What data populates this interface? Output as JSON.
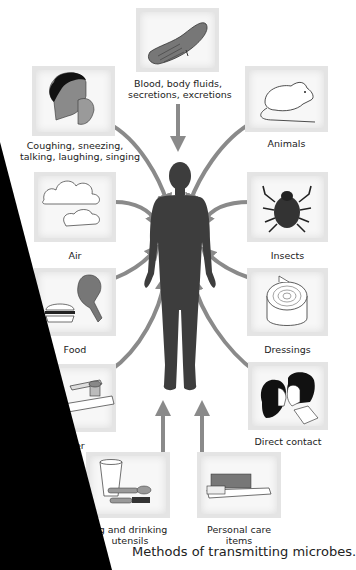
{
  "diagram": {
    "title": "Methods of transmitting microbes",
    "caption": "Methods of transmitting microbes.",
    "center": {
      "label": "Human body",
      "icon": "human-silhouette-icon"
    },
    "colors": {
      "arrow": "#8a8a8a",
      "figure": "#3d3d3d",
      "box_bg": "#f7f7f7",
      "box_border": "#e0e0e0",
      "occluder": "#000000"
    },
    "sources": [
      {
        "id": "blood",
        "label_lines": [
          "Blood, body fluids,",
          "secretions, excretions"
        ],
        "icon": "bleeding-hand-icon",
        "arrow": "down"
      },
      {
        "id": "coughing",
        "label_lines": [
          "Coughing, sneezing,",
          "talking, laughing, singing"
        ],
        "icon": "coughing-person-icon",
        "arrow": "curved-inward"
      },
      {
        "id": "animals",
        "label_lines": [
          "Animals"
        ],
        "icon": "rat-icon",
        "arrow": "curved-inward"
      },
      {
        "id": "air",
        "label_lines": [
          "Air"
        ],
        "icon": "clouds-icon",
        "arrow": "curved-inward"
      },
      {
        "id": "insects",
        "label_lines": [
          "Insects"
        ],
        "icon": "tick-icon",
        "arrow": "curved-inward"
      },
      {
        "id": "food",
        "label_lines": [
          "Food"
        ],
        "icon": "burger-drumstick-icon",
        "arrow": "curved-inward"
      },
      {
        "id": "dressings",
        "label_lines": [
          "Dressings"
        ],
        "icon": "bandage-roll-icon",
        "arrow": "curved-inward"
      },
      {
        "id": "water",
        "label_lines": [
          "ater"
        ],
        "icon": "faucet-icon",
        "arrow": "curved-inward"
      },
      {
        "id": "direct-contact",
        "label_lines": [
          "Direct contact"
        ],
        "icon": "kissing-couple-icon",
        "arrow": "curved-inward"
      },
      {
        "id": "utensils",
        "label_lines": [
          "ng and drinking",
          "utensils"
        ],
        "icon": "glass-spoon-icon",
        "arrow": "up"
      },
      {
        "id": "personal-care",
        "label_lines": [
          "Personal care",
          "items"
        ],
        "icon": "toothbrush-icon",
        "arrow": "up"
      }
    ]
  }
}
